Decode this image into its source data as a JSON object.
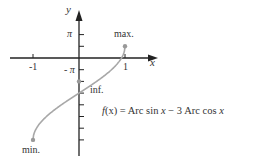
{
  "chart_data": {
    "type": "line",
    "title": "",
    "function_label": "f(x) = Arc sin x − 3 Arc cos x",
    "function_label_parts": {
      "f": "f",
      "rest": "(x) = Arc sin ",
      "x1": "x",
      "mid": " − 3 Arc cos ",
      "x2": "x"
    },
    "xlabel": "x",
    "ylabel": "y",
    "xlim": [
      -1.25,
      1.85
    ],
    "ylim_in_pi": [
      -3.75,
      2.2
    ],
    "x_ticks": [
      {
        "value": -1,
        "label": "-1"
      },
      {
        "value": 1,
        "label": "1"
      }
    ],
    "y_ticks_in_pi": [
      2,
      1,
      -1,
      -2,
      -3,
      -4,
      -5,
      -6,
      -7
    ],
    "y_tick_step_in_pi": 0.5,
    "y_tick_labels": [
      {
        "tick_index": 2,
        "label": "π"
      },
      {
        "tick_index": -1,
        "label": "- π"
      }
    ],
    "series": [
      {
        "name": "f(x)",
        "domain": [
          -1,
          1
        ],
        "expression": "asin(x) - 3*acos(x)",
        "color": "#a8a8a8"
      }
    ],
    "annotations": [
      {
        "label": "max.",
        "x": 1,
        "y_in_pi": 0.5
      },
      {
        "label": "inf.",
        "x": 0,
        "y_in_pi": -1
      },
      {
        "label": "min.",
        "x": -1,
        "y_in_pi": -3.5
      }
    ],
    "grid": false,
    "legend": "none"
  },
  "colors": {
    "axis": "#222222",
    "curve": "#a8a8a8",
    "point": "#999999",
    "text": "#333333"
  }
}
